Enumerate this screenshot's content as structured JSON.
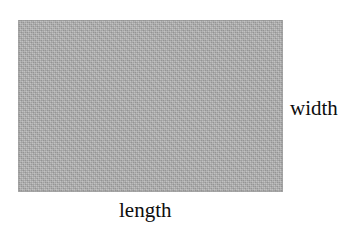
{
  "diagram": {
    "type": "rectangle-dimension-diagram",
    "shape": {
      "name": "rectangle",
      "fill_color": "#a9a9a9",
      "fill_style": "dithered-gray-halftone",
      "background_color": "#ffffff"
    },
    "labels": {
      "width": "width",
      "length": "length"
    },
    "text_color": "#0d0d0d"
  }
}
